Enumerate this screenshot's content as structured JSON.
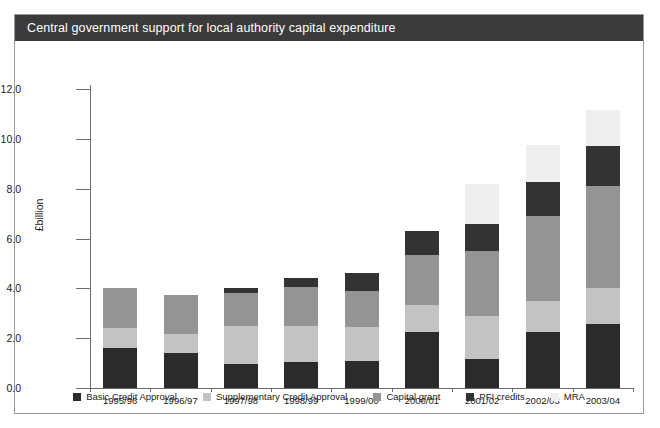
{
  "header": {
    "title": "Central government support for local authority capital expenditure"
  },
  "chart_data": {
    "type": "bar",
    "stacked": true,
    "title": "Central government support for local authority capital expenditure",
    "xlabel": "",
    "ylabel": "£billion",
    "ylim": [
      0.0,
      12.0
    ],
    "ytick_step": 2.0,
    "ytick_labels": [
      "0.0",
      "2.0",
      "4.0",
      "6.0",
      "8.0",
      "10.0",
      "12.0"
    ],
    "ytick_values": [
      0.0,
      2.0,
      4.0,
      6.0,
      8.0,
      10.0,
      12.0
    ],
    "grid": false,
    "legend_position": "bottom",
    "categories": [
      "1995/96",
      "1996/97",
      "1997/98",
      "1998/99",
      "1999/00",
      "2000/01",
      "2001/02",
      "2002/03",
      "2003/04"
    ],
    "series": [
      {
        "name": "Basic Credit Approval",
        "color": "#2b2b2b",
        "values": [
          1.6,
          1.4,
          0.95,
          1.05,
          1.1,
          2.25,
          1.15,
          2.25,
          2.55
        ]
      },
      {
        "name": "Supplementary Credit Approval",
        "color": "#c3c3c3",
        "values": [
          0.8,
          0.75,
          1.55,
          1.45,
          1.35,
          1.1,
          1.75,
          1.25,
          1.45
        ]
      },
      {
        "name": "Capital grant",
        "color": "#949494",
        "values": [
          1.6,
          1.6,
          1.3,
          1.55,
          1.45,
          2.0,
          2.6,
          3.4,
          4.1
        ]
      },
      {
        "name": "PFI credits",
        "color": "#333333",
        "values": [
          0.0,
          0.0,
          0.2,
          0.35,
          0.7,
          0.95,
          1.1,
          1.35,
          1.6
        ]
      },
      {
        "name": "MRA",
        "color": "#efefef",
        "values": [
          0.0,
          0.0,
          0.0,
          0.0,
          0.0,
          0.0,
          1.6,
          1.5,
          1.45
        ]
      }
    ],
    "totals": [
      4.0,
      3.75,
      4.0,
      4.4,
      4.6,
      6.3,
      8.2,
      9.75,
      11.15
    ]
  },
  "legend": {
    "items": [
      {
        "label": "Basic Credit Approval",
        "color": "#2b2b2b"
      },
      {
        "label": "Supplementary Credit Approval",
        "color": "#c3c3c3"
      },
      {
        "label": "Capital grant",
        "color": "#949494"
      },
      {
        "label": "PFI credits",
        "color": "#333333"
      },
      {
        "label": "MRA",
        "color": "#efefef"
      }
    ]
  }
}
